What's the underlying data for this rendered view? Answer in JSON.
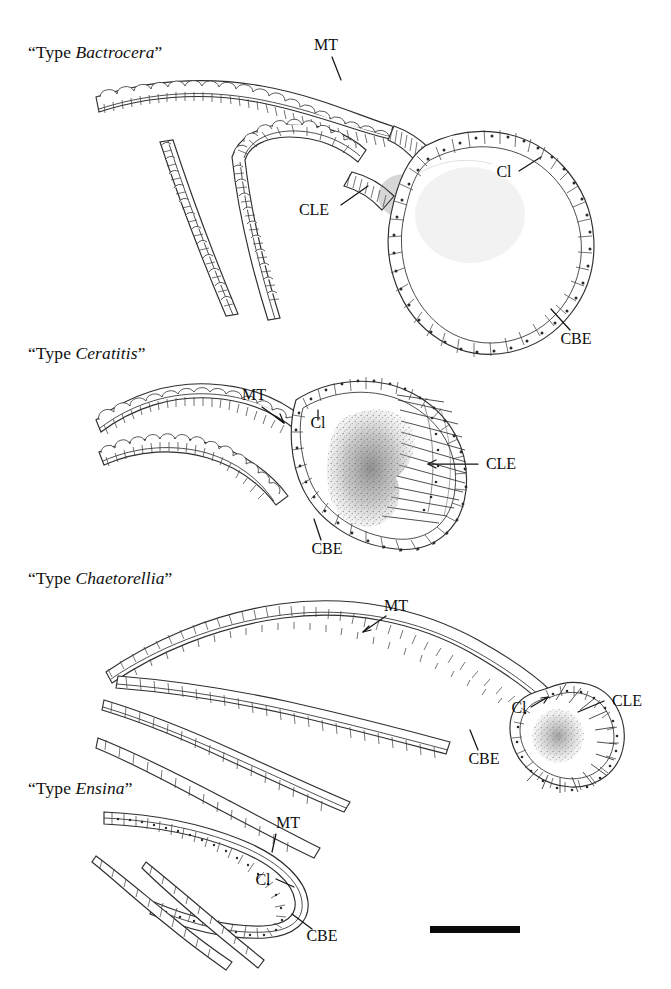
{
  "figure": {
    "background_color": "#ffffff",
    "ink_color": "#2a2a2a",
    "label_color": "#0d0d0d",
    "caption_style": "quoted-type-with-italic-genus"
  },
  "panels": [
    {
      "id": "bactrocera",
      "title_prefix": "“Type ",
      "title_genus": "Bactrocera",
      "title_suffix": "”",
      "title_full": "“Type Bactrocera”",
      "description": "Large spherical bladder with columnar cuboidal epithelium and striated gland patch at tube junction",
      "annotations": [
        {
          "key": "MT",
          "label": "MT",
          "meaning": "Malpighian tubule"
        },
        {
          "key": "CLE",
          "label": "CLE",
          "meaning": "Calcium-loaded / gland epithelium"
        },
        {
          "key": "Cl",
          "label": "Cl",
          "meaning": "Bladder lumen"
        },
        {
          "key": "CBE",
          "label": "CBE",
          "meaning": "Common bladder epithelium"
        }
      ]
    },
    {
      "id": "ceratitis",
      "title_prefix": "“Type ",
      "title_genus": "Ceratitis",
      "title_suffix": "”",
      "title_full": "“Type Ceratitis”",
      "description": "Medium rounded bladder containing dense stippled secretion mass with radiating gland cells on distal wall",
      "annotations": [
        {
          "key": "MT",
          "label": "MT",
          "meaning": "Malpighian tubule"
        },
        {
          "key": "Cl",
          "label": "Cl",
          "meaning": "Bladder lumen"
        },
        {
          "key": "CLE",
          "label": "CLE",
          "meaning": "Calcium-loaded / gland epithelium"
        },
        {
          "key": "CBE",
          "label": "CBE",
          "meaning": "Common bladder epithelium"
        }
      ]
    },
    {
      "id": "chaetorellia",
      "title_prefix": "“Type ",
      "title_genus": "Chaetorellia",
      "title_suffix": "”",
      "title_full": "“Type Chaetorellia”",
      "description": "Elongate tubule with small terminal bladder bearing a radiating fan of gland cells at the apex",
      "annotations": [
        {
          "key": "MT",
          "label": "MT",
          "meaning": "Malpighian tubule"
        },
        {
          "key": "Cl",
          "label": "Cl",
          "meaning": "Bladder lumen"
        },
        {
          "key": "CLE",
          "label": "CLE",
          "meaning": "Calcium-loaded / gland epithelium"
        },
        {
          "key": "CBE",
          "label": "CBE",
          "meaning": "Common bladder epithelium"
        }
      ]
    },
    {
      "id": "ensina",
      "title_prefix": "“Type ",
      "title_genus": "Ensina",
      "title_suffix": "”",
      "title_full": "“Type Ensina”",
      "description": "Simple hairpin loop of tubule without any differentiated bladder swelling",
      "annotations": [
        {
          "key": "MT",
          "label": "MT",
          "meaning": "Malpighian tubule"
        },
        {
          "key": "Cl",
          "label": "Cl",
          "meaning": "Lumen"
        },
        {
          "key": "CBE",
          "label": "CBE",
          "meaning": "Common bladder epithelium"
        }
      ]
    }
  ],
  "scale_bar": {
    "present": true,
    "label": "",
    "color": "#0a0a0a"
  }
}
